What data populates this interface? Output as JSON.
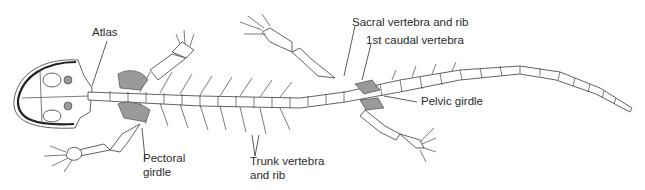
{
  "figure": {
    "labels": {
      "atlas": "Atlas",
      "pectoral_girdle_line1": "Pectoral",
      "pectoral_girdle_line2": "girdle",
      "trunk_line1": "Trunk vertebra",
      "trunk_line2": "and rib",
      "sacral": "Sacral vertebra and rib",
      "first_caudal": "1st caudal vertebra",
      "pelvic_girdle": "Pelvic girdle"
    },
    "colors": {
      "line": "#3a3a3a",
      "hatch": "#9a9a9a",
      "background": "#ffffff"
    }
  }
}
